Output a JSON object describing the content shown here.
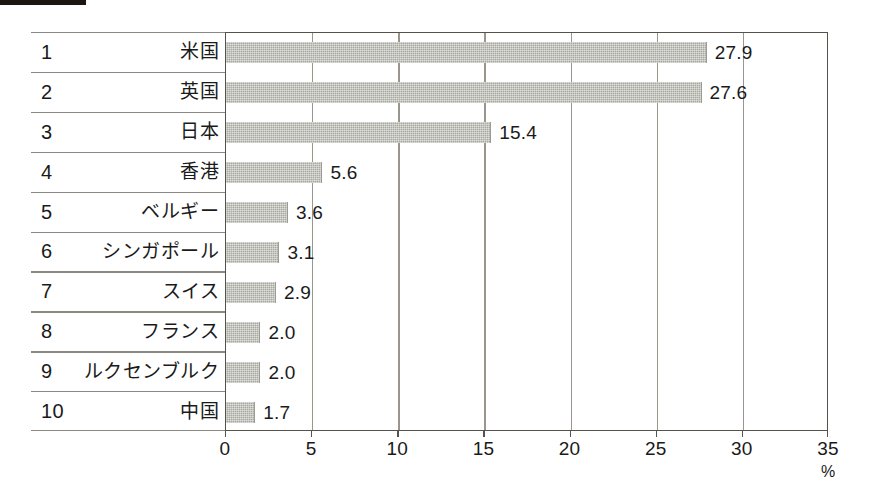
{
  "chart_data": {
    "type": "bar",
    "orientation": "horizontal",
    "title": "",
    "xlabel": "%",
    "ylabel": "",
    "xlim": [
      0,
      35
    ],
    "grid": true,
    "legend": false,
    "categories": [
      "米国",
      "英国",
      "日本",
      "香港",
      "ベルギー",
      "シンガポール",
      "スイス",
      "フランス",
      "ルクセンブルク",
      "中国"
    ],
    "ranks": [
      "1",
      "2",
      "3",
      "4",
      "5",
      "6",
      "7",
      "8",
      "9",
      "10"
    ],
    "values": [
      27.9,
      27.6,
      15.4,
      5.6,
      3.6,
      3.1,
      2.9,
      2.0,
      2.0,
      1.7
    ],
    "value_labels": [
      "27.9",
      "27.6",
      "15.4",
      "5.6",
      "3.6",
      "3.1",
      "2.9",
      "2.0",
      "2.0",
      "1.7"
    ],
    "xticks": [
      0,
      5,
      10,
      15,
      20,
      25,
      30,
      35
    ],
    "xtick_labels": [
      "0",
      "5",
      "10",
      "15",
      "20",
      "25",
      "30",
      "35"
    ],
    "unit": "%",
    "bar_color": "#a9a9a1",
    "axis_color": "#55514b",
    "grid_color": "#9a968e",
    "text_color": "#1a1a1a"
  },
  "rows": [
    {
      "rank": "1",
      "country": "米国",
      "value_label": "27.9"
    },
    {
      "rank": "2",
      "country": "英国",
      "value_label": "27.6"
    },
    {
      "rank": "3",
      "country": "日本",
      "value_label": "15.4"
    },
    {
      "rank": "4",
      "country": "香港",
      "value_label": "5.6"
    },
    {
      "rank": "5",
      "country": "ベルギー",
      "value_label": "3.6"
    },
    {
      "rank": "6",
      "country": "シンガポール",
      "value_label": "3.1"
    },
    {
      "rank": "7",
      "country": "スイス",
      "value_label": "2.9"
    },
    {
      "rank": "8",
      "country": "フランス",
      "value_label": "2.0"
    },
    {
      "rank": "9",
      "country": "ルクセンブルク",
      "value_label": "2.0"
    },
    {
      "rank": "10",
      "country": "中国",
      "value_label": "1.7"
    }
  ],
  "axis": {
    "ticks": [
      "0",
      "5",
      "10",
      "15",
      "20",
      "25",
      "30",
      "35"
    ],
    "unit": "%"
  }
}
